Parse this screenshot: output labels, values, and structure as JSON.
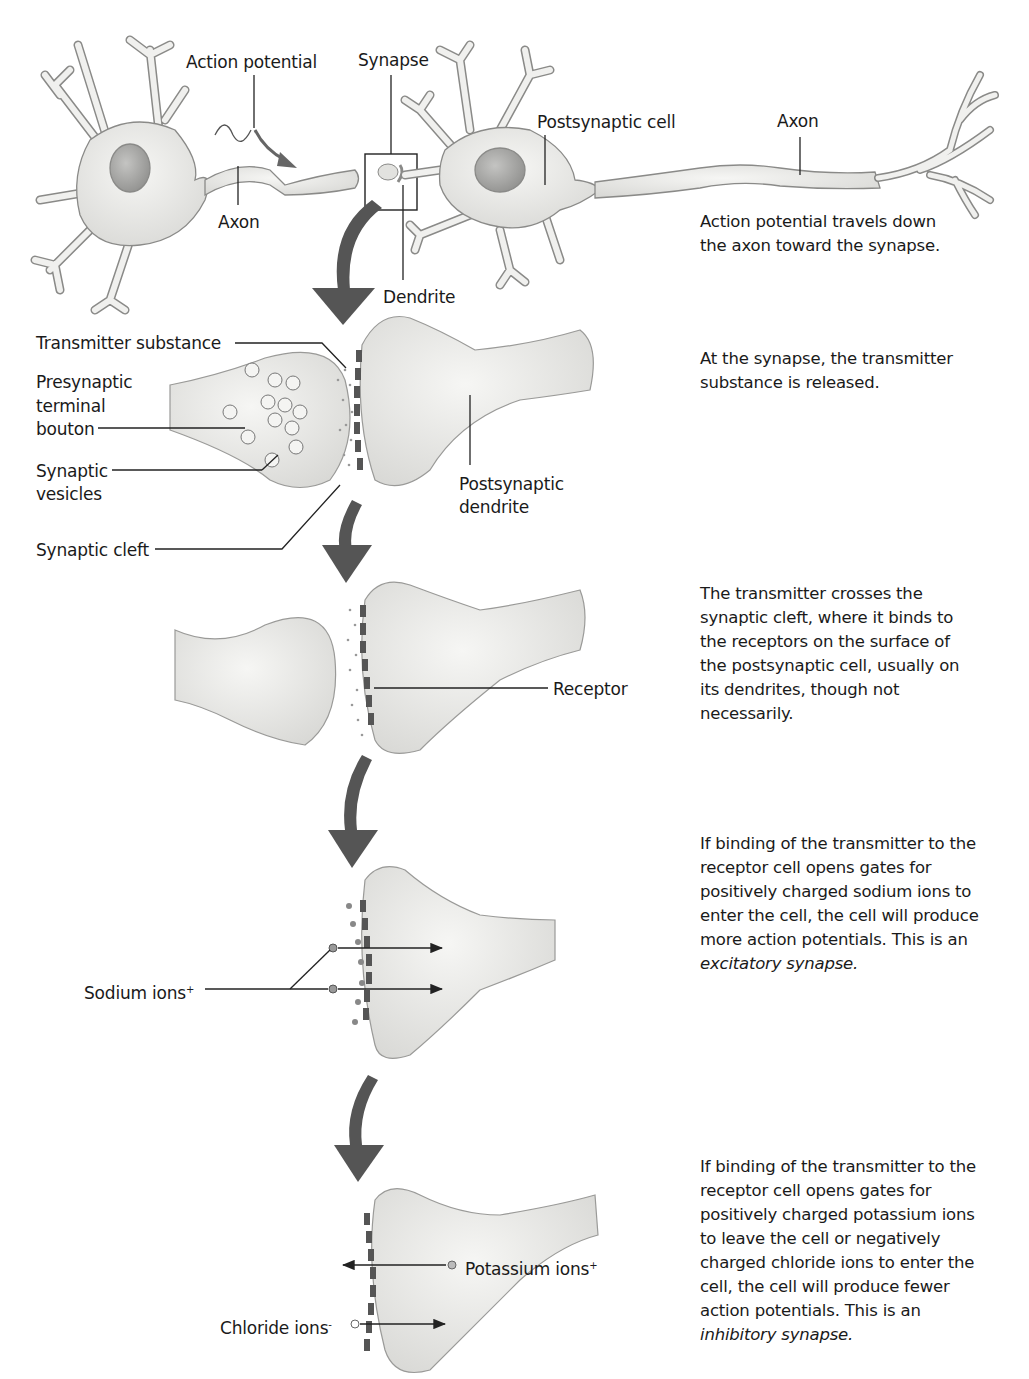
{
  "figure": {
    "top_neurons": {
      "labels": {
        "action_potential": "Action potential",
        "synapse": "Synapse",
        "postsynaptic_cell": "Postsynaptic cell",
        "axon_left": "Axon",
        "axon_right": "Axon",
        "dendrite": "Dendrite"
      },
      "description": "Action potential travels down the axon toward the synapse."
    },
    "synapse_release": {
      "labels": {
        "transmitter_substance": "Transmitter substance",
        "presynaptic_terminal_bouton": [
          "Presynaptic",
          "terminal",
          "bouton"
        ],
        "synaptic_vesicles": [
          "Synaptic",
          "vesicles"
        ],
        "synaptic_cleft": "Synaptic cleft",
        "postsynaptic_dendrite": [
          "Postsynaptic",
          "dendrite"
        ]
      },
      "description": "At the synapse, the transmitter substance is released."
    },
    "receptor_binding": {
      "labels": {
        "receptor": "Receptor"
      },
      "description": "The transmitter crosses the synaptic cleft, where it binds to the receptors on the surface of the postsynaptic cell, usually on its dendrites, though not necessarily."
    },
    "excitatory": {
      "labels": {
        "sodium_ions": "Sodium ions",
        "sodium_charge": "+"
      },
      "description": "If binding of the transmitter to the receptor cell opens gates for positively charged sodium ions to enter the cell, the cell will produce more action potentials. This is an",
      "term": "excitatory synapse."
    },
    "inhibitory": {
      "labels": {
        "potassium_ions": "Potassium ions",
        "potassium_charge": "+",
        "chloride_ions": "Chloride ions",
        "chloride_charge": "-"
      },
      "description": "If binding of the transmitter to the receptor cell opens gates for positively charged potassium ions to leave the cell or negatively charged chloride ions to enter the cell, the cell will produce fewer action potentials. This is an",
      "term": "inhibitory synapse."
    },
    "colors": {
      "cell_fill": "#e9e9e6",
      "cell_stroke": "#8a8a88",
      "arrow": "#555555",
      "receptor": "#5a5a5a",
      "text": "#1a1a1a"
    }
  }
}
